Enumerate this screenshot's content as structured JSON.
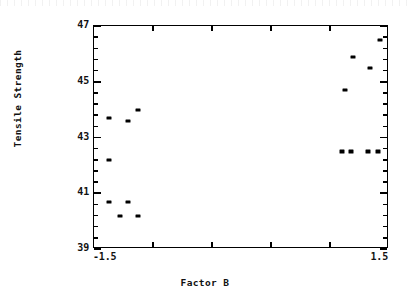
{
  "chart_data": {
    "type": "scatter",
    "title": "",
    "xlabel": "Factor B",
    "ylabel": "Tensile Strength",
    "xlim": [
      -1.5,
      1.5
    ],
    "ylim": [
      39,
      47
    ],
    "grid": false,
    "legend": null,
    "x_tick_labels": [
      "-1.5",
      "1.5"
    ],
    "x_tick_values": [
      -1.5,
      1.5
    ],
    "x_minor_ticks": [
      -0.9,
      -0.3,
      0.3,
      0.9
    ],
    "y_tick_labels": [
      "39",
      "41",
      "43",
      "45",
      "47"
    ],
    "y_tick_values": [
      39,
      41,
      43,
      45,
      47
    ],
    "y_minor_ticks": [
      39.4,
      39.8,
      40.2,
      40.6,
      41.4,
      41.8,
      42.2,
      42.6,
      43.4,
      43.8,
      44.2,
      44.6,
      45.4,
      45.8,
      46.2,
      46.6
    ],
    "marker": "filled-rectangle",
    "marker_color": "#000000",
    "points": [
      {
        "x": -1.35,
        "y": 40.7
      },
      {
        "x": -1.35,
        "y": 42.2
      },
      {
        "x": -1.35,
        "y": 43.7
      },
      {
        "x": -1.24,
        "y": 40.2
      },
      {
        "x": -1.15,
        "y": 40.7
      },
      {
        "x": -1.15,
        "y": 43.6
      },
      {
        "x": -1.05,
        "y": 40.2
      },
      {
        "x": -1.05,
        "y": 44.0
      },
      {
        "x": 1.02,
        "y": 42.5
      },
      {
        "x": 1.05,
        "y": 44.7
      },
      {
        "x": 1.11,
        "y": 42.5
      },
      {
        "x": 1.13,
        "y": 45.9
      },
      {
        "x": 1.29,
        "y": 42.5
      },
      {
        "x": 1.31,
        "y": 45.5
      },
      {
        "x": 1.39,
        "y": 42.5
      },
      {
        "x": 1.41,
        "y": 46.5
      }
    ]
  },
  "axis": {
    "y_title": "Tensile Strength",
    "x_title": "Factor B",
    "y_ticks": [
      {
        "label": "47",
        "value": 47
      },
      {
        "label": "45",
        "value": 45
      },
      {
        "label": "43",
        "value": 43
      },
      {
        "label": "41",
        "value": 41
      },
      {
        "label": "39",
        "value": 39
      }
    ],
    "x_ticks": [
      {
        "label": "-1.5",
        "value": -1.5
      },
      {
        "label": "1.5",
        "value": 1.5
      }
    ]
  }
}
